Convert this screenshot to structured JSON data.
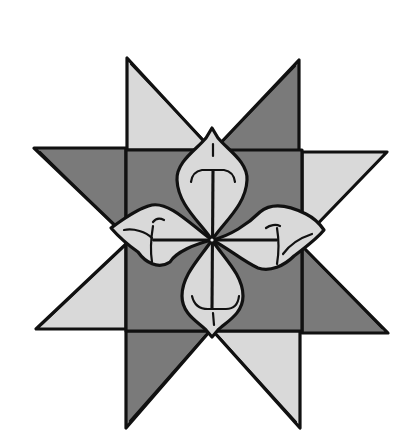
{
  "figure": {
    "subject": "Folded paper eight-pointed star with four petals",
    "colors": {
      "dark_fill": "#7a7a7a",
      "light_fill": "#d9d9d9",
      "outline": "#111111",
      "background": "#ffffff"
    },
    "parts": {
      "center_square": "center-square",
      "points": [
        "point-top-left",
        "point-top-right",
        "point-right-top",
        "point-right-bottom",
        "point-bottom-right",
        "point-bottom-left",
        "point-left-bottom",
        "point-left-top"
      ],
      "petals": [
        "petal-top",
        "petal-right",
        "petal-bottom",
        "petal-left"
      ]
    }
  }
}
